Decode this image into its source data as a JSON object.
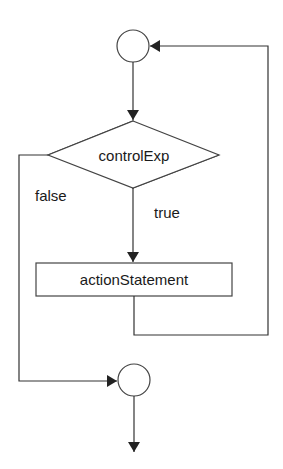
{
  "diagram": {
    "type": "flowchart",
    "nodes": {
      "entry_connector": {
        "shape": "circle"
      },
      "condition": {
        "shape": "diamond",
        "label": "controlExp"
      },
      "action": {
        "shape": "rectangle",
        "label": "actionStatement"
      },
      "exit_connector": {
        "shape": "circle"
      }
    },
    "edges": {
      "true_label": "true",
      "false_label": "false"
    },
    "colors": {
      "stroke": "#333333",
      "background": "#ffffff",
      "text": "#1a1a1a"
    }
  }
}
